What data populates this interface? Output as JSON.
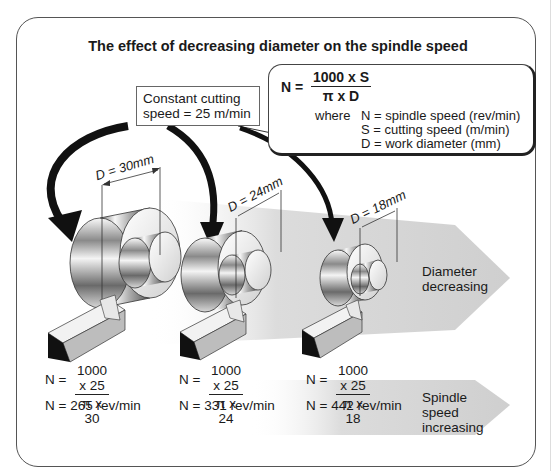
{
  "title": "The effect of decreasing diameter on the spindle speed",
  "formula": {
    "lhs": "N =",
    "numerator": "1000 x S",
    "denominator": "π x D",
    "where_label": "where",
    "definitions": [
      "N = spindle speed (rev/min)",
      "S = cutting speed (m/min)",
      "D = work diameter (mm)"
    ]
  },
  "constant_box": {
    "line1": "Constant cutting",
    "line2": "speed = 25 m/min"
  },
  "workpieces": [
    {
      "dimension": "D = 30mm",
      "lhs": "N =",
      "numerator": "1000 x 25",
      "denominator": "π x 30",
      "result": "N =  265 rev/min"
    },
    {
      "dimension": "D = 24mm",
      "lhs": "N =",
      "numerator": "1000 x 25",
      "denominator": "π x 24",
      "result": "N =  331 rev/min"
    },
    {
      "dimension": "D = 18mm",
      "lhs": "N =",
      "numerator": "1000 x 25",
      "denominator": "π x 18",
      "result": "N =  442 rev/min"
    }
  ],
  "arrows": {
    "diameter": {
      "line1": "Diameter",
      "line2": "decreasing"
    },
    "speed": {
      "line1": "Spindle",
      "line2": "speed",
      "line3": "increasing"
    }
  },
  "colors": {
    "arrow_band": "#d4d4d4",
    "outline": "#555555",
    "tool_dark": "#111111",
    "tool_side": "#bdbdbd"
  }
}
